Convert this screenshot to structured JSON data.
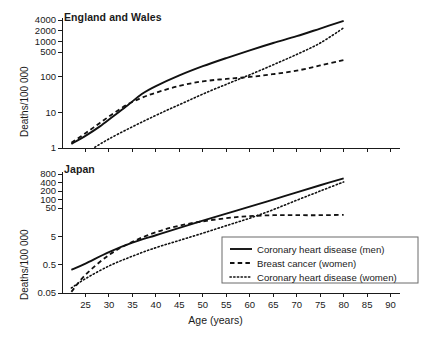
{
  "figure": {
    "xlabel": "Age (years)",
    "ylabel": "Deaths/100 000"
  },
  "legend": {
    "items": [
      {
        "label": "Coronary heart disease (men)",
        "style": "solid"
      },
      {
        "label": "Breast cancer (women)",
        "style": "dashed"
      },
      {
        "label": "Coronary heart disease (women)",
        "style": "dotted"
      }
    ]
  },
  "chart_data": [
    {
      "type": "line",
      "title": "England and Wales",
      "xlabel": "",
      "ylabel": "Deaths/100 000",
      "yscale": "log",
      "ylim": [
        1,
        4000
      ],
      "yticks": [
        1,
        10,
        100,
        500,
        1000,
        2000,
        4000
      ],
      "ytick_labels": [
        "1",
        "10",
        "100",
        "500",
        "1000",
        "2000",
        "4000"
      ],
      "xlim": [
        20,
        92
      ],
      "xticks": [
        25,
        30,
        35,
        40,
        45,
        50,
        55,
        60,
        65,
        70,
        75,
        80,
        85,
        90
      ],
      "xtick_labels": [
        "",
        "",
        "",
        "",
        "",
        "",
        "",
        "",
        "",
        "",
        "",
        "",
        "",
        ""
      ],
      "grid": false,
      "series": [
        {
          "name": "Coronary heart disease (men)",
          "style": "solid",
          "x": [
            22,
            25,
            28,
            31,
            34,
            37,
            40,
            45,
            50,
            55,
            60,
            65,
            70,
            75,
            80
          ],
          "values": [
            1.3,
            2.2,
            4.0,
            8.0,
            16,
            33,
            55,
            110,
            200,
            340,
            560,
            900,
            1400,
            2300,
            3800
          ]
        },
        {
          "name": "Breast cancer (women)",
          "style": "dashed",
          "x": [
            22,
            25,
            28,
            31,
            34,
            37,
            40,
            45,
            50,
            55,
            60,
            65,
            70,
            75,
            80
          ],
          "values": [
            1.4,
            2.6,
            5.0,
            9.5,
            17,
            26,
            36,
            56,
            75,
            88,
            100,
            120,
            150,
            210,
            300
          ]
        },
        {
          "name": "Coronary heart disease (women)",
          "style": "dotted",
          "x": [
            27,
            30,
            34,
            38,
            42,
            46,
            50,
            55,
            60,
            65,
            70,
            75,
            80
          ],
          "values": [
            1.05,
            1.8,
            3.4,
            6.2,
            11,
            19,
            33,
            62,
            115,
            220,
            430,
            900,
            2400
          ]
        }
      ]
    },
    {
      "type": "line",
      "title": "Japan",
      "xlabel": "Age (years)",
      "ylabel": "Deaths/100 000",
      "yscale": "log",
      "ylim": [
        0.05,
        800
      ],
      "yticks": [
        0.05,
        0.5,
        5,
        50,
        100,
        200,
        400,
        800
      ],
      "ytick_labels": [
        "0.05",
        "0.5",
        "5",
        "50",
        "100",
        "200",
        "400",
        "800"
      ],
      "xlim": [
        20,
        92
      ],
      "xticks": [
        25,
        30,
        35,
        40,
        45,
        50,
        55,
        60,
        65,
        70,
        75,
        80,
        85,
        90
      ],
      "xtick_labels": [
        "25",
        "30",
        "35",
        "40",
        "45",
        "50",
        "55",
        "60",
        "65",
        "70",
        "75",
        "80",
        "85",
        "90"
      ],
      "grid": false,
      "series": [
        {
          "name": "Coronary heart disease (men)",
          "style": "solid",
          "x": [
            22,
            25,
            30,
            35,
            40,
            45,
            50,
            55,
            60,
            65,
            70,
            75,
            80
          ],
          "values": [
            0.33,
            0.55,
            1.4,
            3.0,
            5.5,
            10,
            18,
            32,
            56,
            100,
            180,
            320,
            560
          ]
        },
        {
          "name": "Breast cancer (women)",
          "style": "dashed",
          "x": [
            22,
            25,
            30,
            35,
            40,
            45,
            50,
            55,
            60,
            65,
            70,
            75,
            80
          ],
          "values": [
            0.055,
            0.22,
            1.1,
            3.2,
            7.0,
            12,
            17,
            22,
            26,
            28,
            28,
            28,
            29
          ]
        },
        {
          "name": "Coronary heart disease (women)",
          "style": "dotted",
          "x": [
            22,
            25,
            30,
            35,
            40,
            45,
            50,
            55,
            60,
            65,
            70,
            75,
            80
          ],
          "values": [
            0.075,
            0.16,
            0.45,
            1.0,
            2.0,
            3.6,
            6.5,
            12,
            22,
            44,
            95,
            200,
            420
          ]
        }
      ]
    }
  ]
}
